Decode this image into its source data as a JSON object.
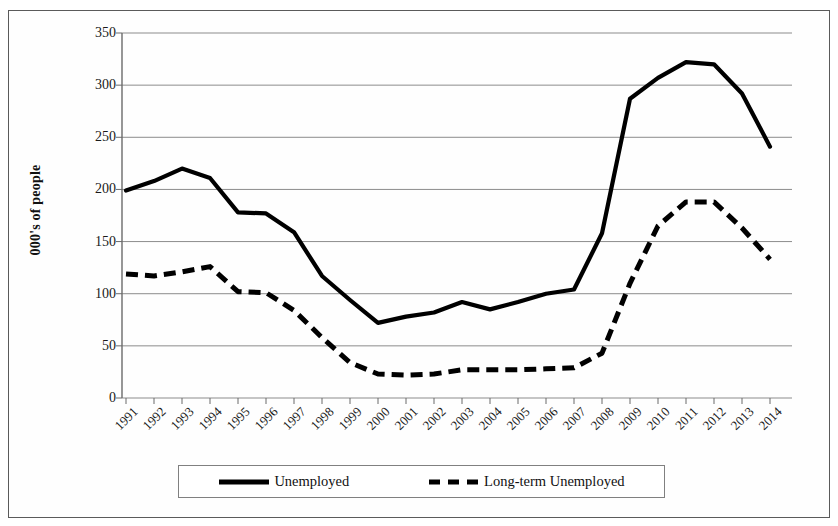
{
  "chart_data": {
    "type": "line",
    "title": "",
    "xlabel": "",
    "ylabel": "000's of people",
    "ylim": [
      0,
      350
    ],
    "yticks": [
      0,
      50,
      100,
      150,
      200,
      250,
      300,
      350
    ],
    "grid": true,
    "legend_position": "bottom",
    "categories": [
      "1991",
      "1992",
      "1993",
      "1994",
      "1995",
      "1996",
      "1997",
      "1998",
      "1999",
      "2000",
      "2001",
      "2002",
      "2003",
      "2004",
      "2005",
      "2006",
      "2007",
      "2008",
      "2009",
      "2010",
      "2011",
      "2012",
      "2013",
      "2014"
    ],
    "series": [
      {
        "name": "Unemployed",
        "style": "solid",
        "color": "#000000",
        "values": [
          199,
          208,
          220,
          211,
          178,
          177,
          159,
          117,
          94,
          72,
          78,
          82,
          92,
          85,
          92,
          100,
          104,
          158,
          287,
          307,
          322,
          320,
          292,
          241
        ]
      },
      {
        "name": "Long-term Unemployed",
        "style": "dashed",
        "color": "#000000",
        "values": [
          119,
          117,
          121,
          126,
          102,
          101,
          84,
          58,
          34,
          23,
          22,
          23,
          27,
          27,
          27,
          28,
          29,
          43,
          110,
          165,
          188,
          188,
          163,
          133
        ]
      }
    ]
  },
  "legend": {
    "entries": [
      {
        "label": "Unemployed",
        "style": "solid"
      },
      {
        "label": "Long-term Unemployed",
        "style": "dashed"
      }
    ]
  },
  "axes": {
    "y_title": "000's of people"
  }
}
